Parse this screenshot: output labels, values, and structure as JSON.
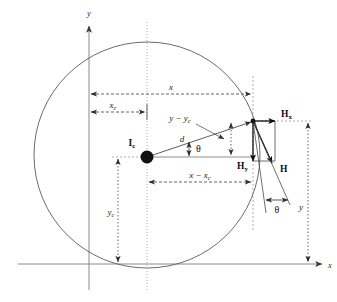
{
  "figure": {
    "axes": {
      "y_axis_label": "y",
      "x_axis_label": "x"
    },
    "labels": {
      "center_marker": "I",
      "center_marker_sub": "c",
      "distance_d": "d",
      "theta_center": "θ",
      "theta_lower": "θ",
      "dim_x": "x",
      "dim_xc": "x",
      "dim_xc_sub": "c",
      "dim_yc": "y",
      "dim_yc_sub": "c",
      "dim_y": "y",
      "dim_x_minus_xc": "x − x",
      "dim_x_minus_xc_sub": "c",
      "dim_y_minus_yc": "y − y",
      "dim_y_minus_yc_sub": "c",
      "vector_H": "H",
      "vector_Hx": "H",
      "vector_Hx_sub": "x",
      "vector_Hy": "H",
      "vector_Hy_sub": "y"
    },
    "colors": {
      "circle_stroke": "#5a5a5a",
      "axis_stroke": "#8a8a8a",
      "dimension_stroke": "#3c3c3c",
      "vector_stroke": "#111111",
      "dotted_stroke": "#9a9a9a",
      "center_dot_fill": "#111111",
      "background": "#ffffff"
    },
    "geometry": {
      "circle_center_x": 147,
      "circle_center_y": 155,
      "circle_radius": 113,
      "y_axis_x": 89,
      "x_axis_y": 264,
      "point_on_circle_x": 253,
      "point_on_circle_y": 121,
      "theta_degrees": 17
    }
  }
}
